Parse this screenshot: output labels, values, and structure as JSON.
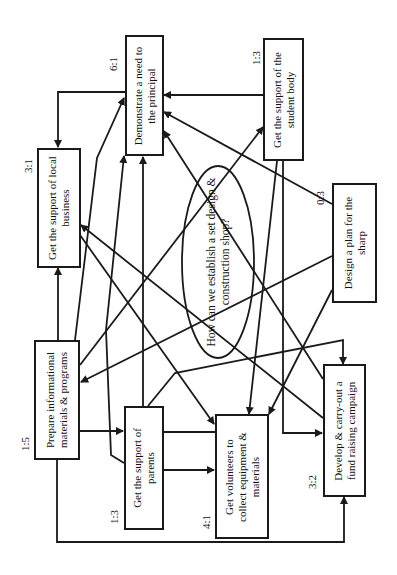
{
  "diagram": {
    "type": "interrelationship-digraph",
    "central_question": "How can we establish a set design &\nconstruction shop?",
    "nodes": [
      {
        "id": "principal",
        "label": "Demonstrate a need to\nthe principal",
        "ratio": "6:1"
      },
      {
        "id": "student_body",
        "label": "Get the support of the\nstudent body",
        "ratio": "1:3"
      },
      {
        "id": "local_business",
        "label": "Get the support of local\nbusiness",
        "ratio": "3:1"
      },
      {
        "id": "design_plan",
        "label": "Design a plan for the\nsharp",
        "ratio": "0:3"
      },
      {
        "id": "info_materials",
        "label": "Prepare informational\nmaterials & programs",
        "ratio": "1:5"
      },
      {
        "id": "parents",
        "label": "Get the support of\nparents",
        "ratio": "1:3"
      },
      {
        "id": "volunteers",
        "label": "Get volunteers to\ncollect equipment &\nmaterials",
        "ratio": "4:1"
      },
      {
        "id": "fund_raising",
        "label": "Develop & carry-out a\nfund raising campaign",
        "ratio": "3:2"
      }
    ],
    "edges": [
      {
        "from": "principal",
        "to": "local_business"
      },
      {
        "from": "student_body",
        "to": "principal"
      },
      {
        "from": "design_plan",
        "to": "principal"
      },
      {
        "from": "fund_raising",
        "to": "principal"
      },
      {
        "from": "info_materials",
        "to": "principal"
      },
      {
        "from": "parents",
        "to": "principal"
      },
      {
        "from": "volunteers",
        "to": "principal"
      },
      {
        "from": "info_materials",
        "to": "local_business"
      },
      {
        "from": "fund_raising",
        "to": "local_business"
      },
      {
        "from": "info_materials",
        "to": "student_body"
      },
      {
        "from": "design_plan",
        "to": "info_materials"
      },
      {
        "from": "info_materials",
        "to": "parents"
      },
      {
        "from": "info_materials",
        "to": "fund_raising"
      },
      {
        "from": "parents",
        "to": "volunteers"
      },
      {
        "from": "student_body",
        "to": "volunteers"
      },
      {
        "from": "design_plan",
        "to": "volunteers"
      },
      {
        "from": "local_business",
        "to": "volunteers"
      },
      {
        "from": "student_body",
        "to": "fund_raising"
      },
      {
        "from": "parents",
        "to": "fund_raising"
      }
    ]
  },
  "colors": {
    "line": "#1a1a1a",
    "background": "#ffffff"
  }
}
